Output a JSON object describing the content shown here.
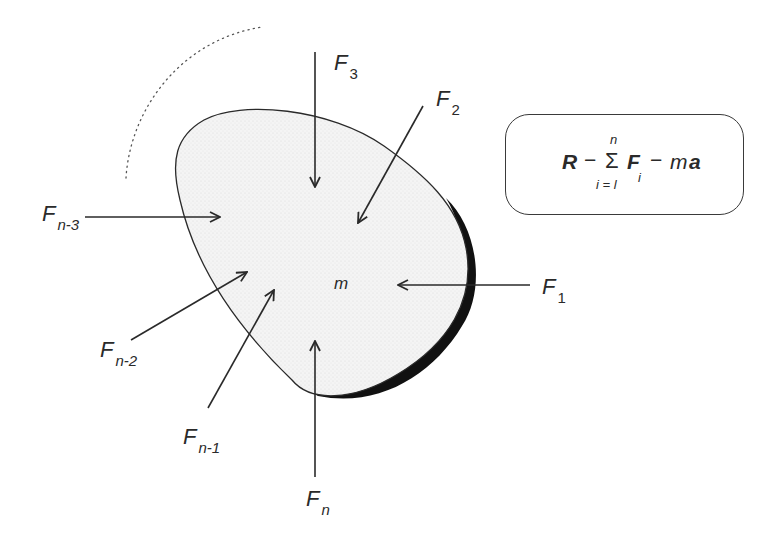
{
  "diagram": {
    "mass_label": "m",
    "colors": {
      "stroke": "#2a2a2a",
      "body_fill": "#f1f1f1",
      "shadow": "#111111",
      "background": "#ffffff"
    },
    "forces": [
      {
        "id": "F1",
        "base": "F",
        "sub": "1",
        "direction": "leftward, toward body from right"
      },
      {
        "id": "F2",
        "base": "F",
        "sub": "2",
        "direction": "down-left, toward body from upper right"
      },
      {
        "id": "F3",
        "base": "F",
        "sub": "3",
        "direction": "downward, toward body from above"
      },
      {
        "id": "Fn-3",
        "base": "F",
        "sub": "n-3",
        "direction": "rightward, toward body from left"
      },
      {
        "id": "Fn-2",
        "base": "F",
        "sub": "n-2",
        "direction": "up-right, toward body from lower left"
      },
      {
        "id": "Fn-1",
        "base": "F",
        "sub": "n-1",
        "direction": "up-right, toward body from below left"
      },
      {
        "id": "Fn",
        "base": "F",
        "sub": "n",
        "direction": "upward, toward body from below"
      }
    ],
    "equation": {
      "R": "R",
      "op1": "−",
      "sigma": "Σ",
      "upper": "n",
      "lower": "i = l",
      "F": "F",
      "F_sub": "i",
      "op2": "−",
      "m": "m",
      "a": "a",
      "text": "R − Σ_{i=l}^{n} F_i − ma"
    }
  }
}
